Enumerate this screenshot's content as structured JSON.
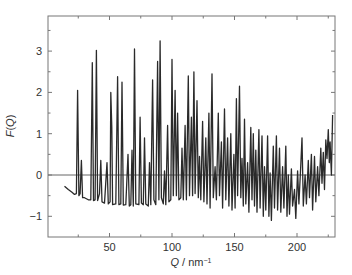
{
  "chart_data": {
    "type": "line",
    "title": "",
    "xlabel": "Q / nm⁻¹",
    "ylabel": "F(Q)",
    "xlim": [
      0,
      230
    ],
    "ylim": [
      -1.5,
      3.8
    ],
    "xticks": [
      50,
      100,
      150,
      200
    ],
    "xminor_ticks": [
      25,
      75,
      125,
      175,
      225
    ],
    "yticks": [
      -1,
      0,
      1,
      2,
      3
    ],
    "yminor_ticks": [
      -0.5,
      0.5,
      1.5,
      2.5,
      3.5
    ],
    "grid": false,
    "legend": null,
    "zero_line": true,
    "colors": {
      "line": "#2a2a2a",
      "axis": "#777777",
      "zero_line": "#555555"
    },
    "series": [
      {
        "name": "F(Q)",
        "points": [
          [
            14,
            -0.27
          ],
          [
            17,
            -0.35
          ],
          [
            20,
            -0.42
          ],
          [
            22,
            -0.47
          ],
          [
            23.5,
            -0.45
          ],
          [
            24.5,
            2.05
          ],
          [
            25.5,
            -0.5
          ],
          [
            26.5,
            -0.45
          ],
          [
            27.5,
            0.35
          ],
          [
            28.5,
            -0.55
          ],
          [
            30,
            -0.55
          ],
          [
            33,
            -0.6
          ],
          [
            35,
            -0.6
          ],
          [
            36.2,
            2.72
          ],
          [
            37.2,
            -0.62
          ],
          [
            38.5,
            -0.6
          ],
          [
            39.5,
            3.02
          ],
          [
            40.5,
            -0.62
          ],
          [
            42,
            -0.45
          ],
          [
            43,
            0.35
          ],
          [
            44,
            -0.65
          ],
          [
            46,
            -0.68
          ],
          [
            48,
            0.3
          ],
          [
            49,
            -0.7
          ],
          [
            50.5,
            -0.65
          ],
          [
            51,
            2.0
          ],
          [
            51.8,
            1.15
          ],
          [
            52.5,
            -0.72
          ],
          [
            55,
            -0.7
          ],
          [
            56.5,
            2.38
          ],
          [
            57.5,
            -0.72
          ],
          [
            59,
            -0.7
          ],
          [
            60,
            2.25
          ],
          [
            61,
            -0.73
          ],
          [
            63,
            -0.72
          ],
          [
            64.8,
            0.5
          ],
          [
            65.8,
            -0.75
          ],
          [
            67,
            -0.72
          ],
          [
            68,
            0.6
          ],
          [
            69,
            -0.75
          ],
          [
            70,
            3.05
          ],
          [
            71,
            -0.7
          ],
          [
            73.5,
            -0.72
          ],
          [
            74.5,
            1.4
          ],
          [
            75.5,
            -0.68
          ],
          [
            77,
            -0.72
          ],
          [
            78,
            0.9
          ],
          [
            79,
            -0.7
          ],
          [
            81,
            -0.75
          ],
          [
            82,
            0.3
          ],
          [
            83,
            -0.72
          ],
          [
            84.5,
            2.3
          ],
          [
            85.5,
            -0.6
          ],
          [
            87,
            -0.72
          ],
          [
            88.5,
            2.75
          ],
          [
            89.5,
            -0.6
          ],
          [
            90.5,
            3.25
          ],
          [
            91.5,
            -0.55
          ],
          [
            93,
            -0.7
          ],
          [
            94,
            0.1
          ],
          [
            95,
            -0.72
          ],
          [
            96.5,
            1.2
          ],
          [
            97.5,
            -0.65
          ],
          [
            99,
            -0.6
          ],
          [
            100,
            2.8
          ],
          [
            101,
            -0.5
          ],
          [
            102.5,
            2.05
          ],
          [
            103.5,
            -0.5
          ],
          [
            104.5,
            1.5
          ],
          [
            105.5,
            -0.6
          ],
          [
            107,
            -0.55
          ],
          [
            108,
            0.65
          ],
          [
            109,
            -0.6
          ],
          [
            110.5,
            1.2
          ],
          [
            111.5,
            -0.6
          ],
          [
            113,
            2.4
          ],
          [
            114,
            -0.5
          ],
          [
            115.5,
            1.4
          ],
          [
            116.5,
            -0.5
          ],
          [
            117.5,
            2.5
          ],
          [
            118.5,
            -0.45
          ],
          [
            120,
            1.8
          ],
          [
            121,
            -0.55
          ],
          [
            122,
            0.45
          ],
          [
            123,
            -0.6
          ],
          [
            124.5,
            1.3
          ],
          [
            125.5,
            -0.65
          ],
          [
            127,
            0.9
          ],
          [
            128,
            -0.7
          ],
          [
            129.5,
            1.5
          ],
          [
            130.5,
            -0.8
          ],
          [
            132,
            2.45
          ],
          [
            133,
            -0.55
          ],
          [
            134.5,
            0.2
          ],
          [
            135.5,
            -0.6
          ],
          [
            137,
            1.5
          ],
          [
            138,
            -0.5
          ],
          [
            139.5,
            0.8
          ],
          [
            140.5,
            -0.8
          ],
          [
            142,
            1.6
          ],
          [
            143,
            -0.6
          ],
          [
            144.5,
            0.9
          ],
          [
            145.5,
            -0.75
          ],
          [
            147,
            1.0
          ],
          [
            148,
            -0.85
          ],
          [
            149.5,
            0.5
          ],
          [
            150.5,
            -0.8
          ],
          [
            151.5,
            1.85
          ],
          [
            152.5,
            -0.5
          ],
          [
            154,
            2.15
          ],
          [
            155,
            -0.55
          ],
          [
            156,
            0.4
          ],
          [
            157,
            -0.75
          ],
          [
            158,
            1.35
          ],
          [
            159,
            -0.7
          ],
          [
            160.5,
            0.3
          ],
          [
            161.5,
            -0.9
          ],
          [
            163,
            1.15
          ],
          [
            164,
            -0.6
          ],
          [
            165,
            1.0
          ],
          [
            166,
            -0.75
          ],
          [
            167,
            0.6
          ],
          [
            168,
            -0.9
          ],
          [
            169.5,
            1.1
          ],
          [
            170.5,
            -0.8
          ],
          [
            172,
            0.95
          ],
          [
            173,
            -1.0
          ],
          [
            174,
            0.2
          ],
          [
            175,
            -0.85
          ],
          [
            176.5,
            0.95
          ],
          [
            177.5,
            -1.0
          ],
          [
            178.5,
            0.05
          ],
          [
            179.5,
            -1.1
          ],
          [
            181,
            0.7
          ],
          [
            182,
            -0.8
          ],
          [
            183.5,
            0.95
          ],
          [
            184.5,
            -0.85
          ],
          [
            186,
            0.65
          ],
          [
            187,
            -0.9
          ],
          [
            188.5,
            0.2
          ],
          [
            189.5,
            -0.8
          ],
          [
            191,
            0.7
          ],
          [
            192,
            -1.0
          ],
          [
            193,
            0.0
          ],
          [
            194,
            -0.95
          ],
          [
            195.5,
            0.15
          ],
          [
            196.5,
            -0.75
          ],
          [
            198,
            -0.35
          ],
          [
            199,
            -1.05
          ],
          [
            200.5,
            0.1
          ],
          [
            201.5,
            -0.7
          ],
          [
            203,
            0.25
          ],
          [
            204,
            0.9
          ],
          [
            205,
            -0.75
          ],
          [
            206.5,
            0.0
          ],
          [
            207.5,
            -0.7
          ],
          [
            209,
            0.35
          ],
          [
            210,
            -0.55
          ],
          [
            211.5,
            0.5
          ],
          [
            212.5,
            -0.85
          ],
          [
            214,
            0.45
          ],
          [
            215,
            -0.65
          ],
          [
            216.5,
            0.2
          ],
          [
            217.5,
            -0.5
          ],
          [
            219,
            0.65
          ],
          [
            220,
            -0.2
          ],
          [
            221,
            0.55
          ],
          [
            222,
            -0.35
          ],
          [
            223,
            0.85
          ],
          [
            224,
            0.4
          ],
          [
            225,
            1.1
          ],
          [
            225.8,
            0.3
          ],
          [
            226.5,
            0.8
          ],
          [
            227.5,
            0.0
          ],
          [
            228.5,
            1.45
          ]
        ]
      }
    ]
  }
}
